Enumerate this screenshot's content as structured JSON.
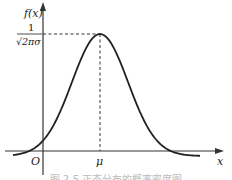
{
  "chart_data": {
    "type": "line",
    "title": "",
    "caption": "图 2-5 正态分布的概率密度图",
    "xlabel": "x",
    "ylabel": "f(x)",
    "origin_label": "O",
    "x_tick_labels": [
      "μ"
    ],
    "y_tick_labels": [
      "1/(√(2π)σ)"
    ],
    "peak_label_numerator": "1",
    "peak_label_denominator": "√2πσ",
    "series": [
      {
        "name": "normal density curve",
        "description": "bell-shaped curve symmetric about x = μ, peak value 1/(√(2π)σ)",
        "x": [
          -3.2,
          -2.5,
          -2,
          -1.5,
          -1,
          -0.5,
          0,
          0.5,
          1,
          1.5,
          2,
          2.5,
          3.2
        ],
        "y": [
          0.006,
          0.044,
          0.135,
          0.325,
          0.607,
          0.882,
          1.0,
          0.882,
          0.607,
          0.325,
          0.135,
          0.044,
          0.006
        ]
      }
    ],
    "annotations": [
      "dashed vertical line at x = μ",
      "dashed horizontal line at peak height"
    ],
    "grid": false,
    "legend": "none"
  }
}
